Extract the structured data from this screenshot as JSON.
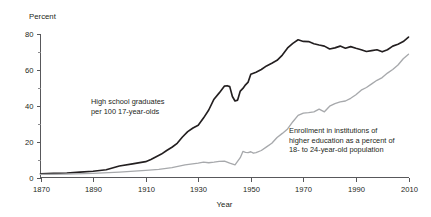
{
  "chart_data": {
    "type": "line",
    "title": "",
    "xlabel": "Year",
    "ylabel": "Percent",
    "grid": false,
    "legend_position": "inline-annotations",
    "xlim": [
      1869,
      2011
    ],
    "ylim": [
      0,
      82
    ],
    "x_ticks": [
      1870,
      1890,
      1910,
      1930,
      1950,
      1970,
      1990,
      2010
    ],
    "x_tick_labels": [
      "1870",
      "1890",
      "1910",
      "1930",
      "1950",
      "1970",
      "1990",
      "2010"
    ],
    "x_minor_ticks": [
      1880,
      1900,
      1920,
      1940,
      1960,
      1980,
      2000
    ],
    "y_ticks": [
      0,
      20,
      40,
      60,
      80
    ],
    "y_tick_labels": [
      "0",
      "20",
      "40",
      "60",
      "80"
    ],
    "y_minor_ticks": [
      10,
      30,
      50,
      70
    ],
    "annotations": [
      {
        "name": "high-school-annotation",
        "lines": [
          "High school graduates",
          "per 100 17-year-olds"
        ],
        "x": 91,
        "y": 104
      },
      {
        "name": "higher-education-annotation",
        "lines": [
          "Enrollment in institutions of",
          "higher education as a percent of",
          "18- to 24-year-old population"
        ],
        "x": 289,
        "y": 133
      }
    ],
    "series": [
      {
        "name": "High school graduates per 100 17-year-olds",
        "color": "#231f20",
        "x": [
          1870,
          1875,
          1880,
          1885,
          1890,
          1895,
          1900,
          1905,
          1910,
          1912,
          1914,
          1916,
          1918,
          1920,
          1922,
          1924,
          1926,
          1928,
          1930,
          1932,
          1934,
          1936,
          1938,
          1940,
          1941,
          1942,
          1943,
          1944,
          1945,
          1946,
          1947,
          1948,
          1949,
          1950,
          1952,
          1954,
          1956,
          1958,
          1960,
          1962,
          1964,
          1966,
          1968,
          1970,
          1972,
          1974,
          1976,
          1978,
          1980,
          1982,
          1984,
          1986,
          1988,
          1990,
          1992,
          1994,
          1996,
          1998,
          2000,
          2002,
          2004,
          2006,
          2008,
          2010
        ],
        "values": [
          2.0,
          2.3,
          2.5,
          3.0,
          3.5,
          4.3,
          6.4,
          7.6,
          8.8,
          10.0,
          11.5,
          13.0,
          15.0,
          16.8,
          19.0,
          22.5,
          25.5,
          27.5,
          29.0,
          33.0,
          37.5,
          43.5,
          47.0,
          50.8,
          51.0,
          50.5,
          45.0,
          42.5,
          43.0,
          48.0,
          49.5,
          51.5,
          53.0,
          57.4,
          58.5,
          60.0,
          62.0,
          63.5,
          65.1,
          68.0,
          72.0,
          74.5,
          76.5,
          75.6,
          75.5,
          74.3,
          73.6,
          73.0,
          71.4,
          72.0,
          73.0,
          71.8,
          72.7,
          71.8,
          71.0,
          70.0,
          70.5,
          71.0,
          69.8,
          71.0,
          73.0,
          74.0,
          75.5,
          78.0
        ]
      },
      {
        "name": "Enrollment in institutions of higher education as a percent of 18- to 24-year-old population",
        "color": "#a7a9ac",
        "x": [
          1870,
          1880,
          1890,
          1900,
          1910,
          1915,
          1920,
          1925,
          1930,
          1932,
          1934,
          1936,
          1938,
          1940,
          1942,
          1944,
          1946,
          1947,
          1948,
          1949,
          1950,
          1951,
          1952,
          1954,
          1956,
          1958,
          1960,
          1962,
          1964,
          1966,
          1968,
          1970,
          1972,
          1974,
          1976,
          1978,
          1980,
          1982,
          1984,
          1986,
          1988,
          1990,
          1992,
          1994,
          1996,
          1998,
          2000,
          2002,
          2004,
          2006,
          2008,
          2010
        ],
        "values": [
          1.7,
          1.9,
          2.3,
          3.0,
          4.0,
          4.5,
          5.5,
          7.0,
          8.0,
          8.5,
          8.2,
          8.5,
          9.0,
          9.1,
          8.0,
          7.0,
          11.0,
          14.5,
          14.0,
          13.8,
          14.3,
          13.5,
          13.8,
          15.0,
          17.0,
          19.0,
          22.2,
          24.5,
          27.0,
          31.0,
          34.5,
          35.8,
          36.0,
          36.5,
          38.0,
          36.5,
          39.6,
          41.0,
          42.0,
          42.5,
          44.0,
          46.0,
          48.5,
          50.0,
          52.0,
          54.0,
          55.5,
          58.0,
          60.0,
          62.5,
          66.0,
          68.5
        ]
      }
    ]
  },
  "axis": {
    "y_title": "Percent",
    "x_title": "Year"
  }
}
